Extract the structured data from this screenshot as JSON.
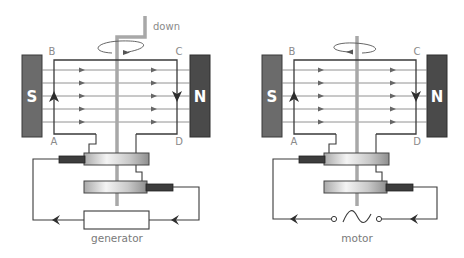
{
  "colors": {
    "wire": "#3a3a3a",
    "field_line": "#777777",
    "shaft": "#a8a8a8",
    "magnet_s": "#6b6b6b",
    "magnet_n": "#4a4a4a",
    "brush": "#3d3d3d",
    "label": "#8a8a8a"
  },
  "generator": {
    "caption": "generator",
    "shaft_label": "down",
    "magnet_left": "S",
    "magnet_right": "N",
    "corners": {
      "top_left": "B",
      "top_right": "C",
      "bottom_left": "A",
      "bottom_right": "D"
    },
    "rotation": "clockwise-front-right",
    "load": "resistor"
  },
  "motor": {
    "caption": "motor",
    "magnet_left": "S",
    "magnet_right": "N",
    "corners": {
      "top_left": "B",
      "top_right": "C",
      "bottom_left": "A",
      "bottom_right": "D"
    },
    "rotation": "counterclockwise-front-left",
    "source": "ac-supply-symbol"
  }
}
